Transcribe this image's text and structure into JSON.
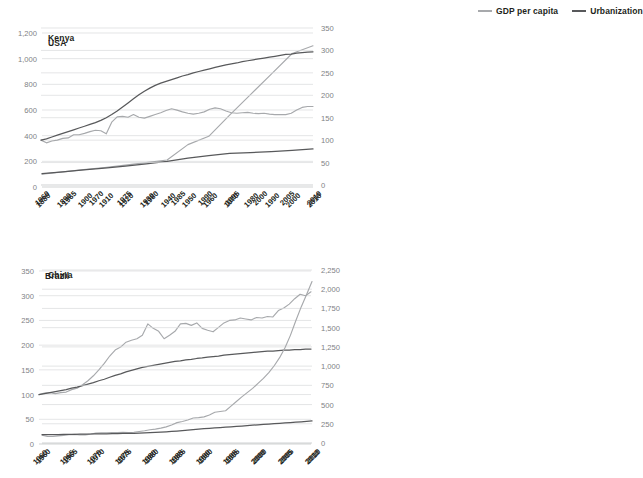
{
  "legend": {
    "position": "top-right",
    "items": [
      {
        "label": "GDP per capita",
        "color": "#a7a9ac",
        "name": "gdp-per-capita"
      },
      {
        "label": "Urbanization",
        "color": "#58595b",
        "name": "urbanization"
      }
    ]
  },
  "chart_data": [
    {
      "type": "line",
      "title": "USA",
      "xlabel": "",
      "ylabel": "",
      "grid": true,
      "legend_position": "top-right",
      "xlim": [
        1880,
        2010
      ],
      "ylim": [
        0,
        1200
      ],
      "xticks": [
        "1880",
        "1890",
        "1900",
        "1910",
        "1920",
        "1930",
        "1940",
        "1950",
        "1960",
        "1970",
        "1980",
        "1990",
        "2000",
        "2010"
      ],
      "yticks": [
        "0",
        "200",
        "400",
        "600",
        "800",
        "1,000",
        "1,200"
      ],
      "x": [
        1880,
        1890,
        1900,
        1910,
        1920,
        1930,
        1940,
        1950,
        1960,
        1970,
        1980,
        1990,
        2000,
        2010
      ],
      "series": [
        {
          "name": "GDP per capita",
          "color": "#a7a9ac",
          "values": [
            100,
            118,
            135,
            152,
            170,
            190,
            210,
            330,
            395,
            560,
            720,
            880,
            1040,
            1100
          ]
        },
        {
          "name": "Urbanization",
          "color": "#58595b",
          "values": [
            105,
            118,
            133,
            148,
            163,
            180,
            200,
            225,
            245,
            262,
            268,
            275,
            285,
            297
          ]
        }
      ]
    },
    {
      "type": "line",
      "title": "Kenya",
      "xlabel": "",
      "ylabel": "",
      "grid": true,
      "legend_position": "top-right",
      "xlim": [
        1960,
        2010
      ],
      "ylim": [
        0,
        350
      ],
      "xticks": [
        "1960",
        "1965",
        "1970",
        "1975",
        "1980",
        "1985",
        "1990",
        "1995",
        "2000",
        "2005",
        "2010"
      ],
      "yticks": [
        "0",
        "50",
        "100",
        "150",
        "200",
        "250",
        "300",
        "350"
      ],
      "x": [
        1960,
        1961,
        1962,
        1963,
        1964,
        1965,
        1966,
        1967,
        1968,
        1969,
        1970,
        1971,
        1972,
        1973,
        1974,
        1975,
        1976,
        1977,
        1978,
        1979,
        1980,
        1981,
        1982,
        1983,
        1984,
        1985,
        1986,
        1987,
        1988,
        1989,
        1990,
        1991,
        1992,
        1993,
        1994,
        1995,
        1996,
        1997,
        1998,
        1999,
        2000,
        2001,
        2002,
        2003,
        2004,
        2005,
        2006,
        2007,
        2008,
        2009,
        2010
      ],
      "series": [
        {
          "name": "GDP per capita",
          "color": "#a7a9ac",
          "values": [
            100,
            94,
            98,
            100,
            104,
            105,
            112,
            112,
            115,
            119,
            122,
            121,
            114,
            140,
            152,
            153,
            151,
            157,
            151,
            149,
            153,
            157,
            161,
            166,
            170,
            167,
            163,
            160,
            158,
            160,
            163,
            169,
            172,
            170,
            165,
            161,
            160,
            161,
            162,
            160,
            159,
            160,
            158,
            157,
            157,
            157,
            160,
            167,
            173,
            175,
            175
          ]
        },
        {
          "name": "Urbanization",
          "color": "#58595b",
          "values": [
            100,
            103,
            107,
            111,
            115,
            119,
            123,
            127,
            131,
            135,
            139,
            144,
            150,
            157,
            165,
            174,
            183,
            192,
            201,
            209,
            216,
            222,
            227,
            231,
            235,
            239,
            243,
            246,
            250,
            253,
            256,
            259,
            262,
            265,
            268,
            270,
            272,
            275,
            277,
            279,
            281,
            283,
            285,
            287,
            289,
            291,
            292,
            294,
            295,
            296,
            297
          ]
        }
      ]
    },
    {
      "type": "line",
      "title": "Brazil",
      "xlabel": "",
      "ylabel": "",
      "grid": true,
      "legend_position": "top-right",
      "xlim": [
        1960,
        2010
      ],
      "ylim": [
        0,
        350
      ],
      "xticks": [
        "1960",
        "1965",
        "1970",
        "1975",
        "1980",
        "1985",
        "1990",
        "1995",
        "2000",
        "2005",
        "2010"
      ],
      "yticks": [
        "0",
        "50",
        "100",
        "150",
        "200",
        "250",
        "300",
        "350"
      ],
      "x": [
        1960,
        1961,
        1962,
        1963,
        1964,
        1965,
        1966,
        1967,
        1968,
        1969,
        1970,
        1971,
        1972,
        1973,
        1974,
        1975,
        1976,
        1977,
        1978,
        1979,
        1980,
        1981,
        1982,
        1983,
        1984,
        1985,
        1986,
        1987,
        1988,
        1989,
        1990,
        1991,
        1992,
        1993,
        1994,
        1995,
        1996,
        1997,
        1998,
        1999,
        2000,
        2001,
        2002,
        2003,
        2004,
        2005,
        2006,
        2007,
        2008,
        2009,
        2010
      ],
      "series": [
        {
          "name": "GDP per capita",
          "color": "#a7a9ac",
          "values": [
            100,
            103,
            104,
            102,
            104,
            105,
            110,
            113,
            120,
            128,
            138,
            150,
            163,
            178,
            190,
            196,
            206,
            210,
            213,
            220,
            243,
            234,
            228,
            213,
            220,
            228,
            243,
            244,
            240,
            245,
            234,
            230,
            227,
            236,
            245,
            250,
            251,
            255,
            253,
            251,
            256,
            255,
            258,
            257,
            270,
            275,
            283,
            294,
            303,
            300,
            308
          ]
        },
        {
          "name": "Urbanization",
          "color": "#58595b",
          "values": [
            100,
            102,
            104,
            106,
            108,
            110,
            113,
            115,
            118,
            121,
            124,
            128,
            131,
            135,
            139,
            142,
            146,
            149,
            152,
            155,
            157,
            159,
            161,
            163,
            165,
            167,
            168,
            170,
            171,
            173,
            174,
            176,
            177,
            178,
            180,
            181,
            182,
            183,
            184,
            185,
            186,
            187,
            188,
            188,
            189,
            190,
            190,
            191,
            191,
            192,
            192
          ]
        }
      ]
    },
    {
      "type": "line",
      "title": "China",
      "xlabel": "",
      "ylabel": "",
      "grid": true,
      "legend_position": "top-right",
      "xlim": [
        1960,
        2010
      ],
      "ylim": [
        0,
        2250
      ],
      "xticks": [
        "1960",
        "1965",
        "1970",
        "1975",
        "1980",
        "1985",
        "1990",
        "1995",
        "2000",
        "2005",
        "2010"
      ],
      "yticks": [
        "0",
        "250",
        "500",
        "750",
        "1,000",
        "1,250",
        "1,500",
        "1,750",
        "2,000",
        "2,250"
      ],
      "x": [
        1960,
        1961,
        1962,
        1963,
        1964,
        1965,
        1966,
        1967,
        1968,
        1969,
        1970,
        1971,
        1972,
        1973,
        1974,
        1975,
        1976,
        1977,
        1978,
        1979,
        1980,
        1981,
        1982,
        1983,
        1984,
        1985,
        1986,
        1987,
        1988,
        1989,
        1990,
        1991,
        1992,
        1993,
        1994,
        1995,
        1996,
        1997,
        1998,
        1999,
        2000,
        2001,
        2002,
        2003,
        2004,
        2005,
        2006,
        2007,
        2008,
        2009,
        2010
      ],
      "series": [
        {
          "name": "GDP per capita",
          "color": "#a7a9ac",
          "values": [
            100,
            86,
            85,
            92,
            100,
            108,
            112,
            106,
            106,
            116,
            128,
            132,
            132,
            137,
            135,
            140,
            135,
            140,
            150,
            160,
            172,
            180,
            193,
            210,
            235,
            265,
            280,
            300,
            325,
            330,
            340,
            365,
            400,
            410,
            420,
            480,
            540,
            600,
            655,
            710,
            775,
            840,
            915,
            1005,
            1110,
            1240,
            1400,
            1590,
            1770,
            1930,
            2100
          ]
        },
        {
          "name": "Urbanization",
          "color": "#58595b",
          "values": [
            110,
            110,
            109,
            110,
            111,
            112,
            113,
            114,
            115,
            117,
            118,
            119,
            120,
            121,
            122,
            124,
            125,
            126,
            128,
            131,
            134,
            137,
            141,
            145,
            150,
            156,
            162,
            168,
            174,
            180,
            186,
            191,
            196,
            201,
            206,
            211,
            216,
            221,
            226,
            231,
            236,
            241,
            246,
            251,
            256,
            261,
            266,
            271,
            276,
            282,
            288
          ]
        }
      ]
    }
  ]
}
